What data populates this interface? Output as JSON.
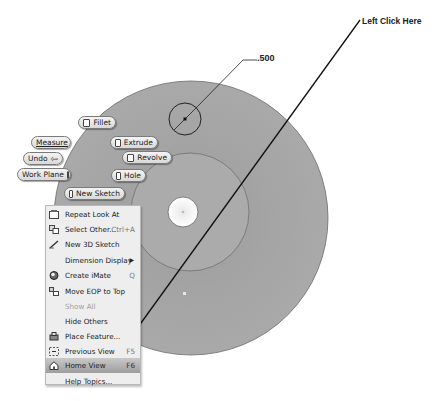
{
  "viewport": {
    "part": {
      "disk_color": "#a6a6a6",
      "hub_color": "#aaaaaa",
      "hole_color": "#ffffff",
      "outer_center": [
        191,
        218
      ],
      "outer_radius": 137,
      "hub_center": [
        190,
        212
      ],
      "hub_radius": 59,
      "hole_center": [
        183,
        212
      ],
      "hole_radius": 15,
      "sketch_circle_center": [
        185,
        119
      ],
      "sketch_circle_radius": 16
    },
    "dimension": {
      "value": ".500"
    },
    "callout": {
      "text": "Left Click Here"
    }
  },
  "marking_menu": {
    "fillet": "Fillet",
    "measure": "Measure",
    "extrude": "Extrude",
    "undo": "Undo",
    "revolve": "Revolve",
    "work_plane": "Work Plane",
    "hole": "Hole",
    "new_sketch": "New Sketch"
  },
  "context_menu": {
    "items": [
      {
        "label": "Repeat Look At",
        "hotkey": "",
        "icon": "look-at-icon"
      },
      {
        "label": "Select Other...",
        "hotkey": "Ctrl+A",
        "icon": "select-other-icon"
      },
      {
        "label": "New 3D Sketch",
        "hotkey": "",
        "icon": "3d-sketch-icon"
      },
      {
        "label": "Dimension Display",
        "hotkey": "",
        "icon": "",
        "submenu": "▶"
      },
      {
        "label": "Create iMate",
        "hotkey": "Q",
        "icon": "imate-icon"
      },
      {
        "label": "Move EOP to Top",
        "hotkey": "",
        "icon": "eop-icon"
      },
      {
        "label": "Show All",
        "hotkey": "",
        "icon": "",
        "disabled": true
      },
      {
        "label": "Hide Others",
        "hotkey": "",
        "icon": ""
      },
      {
        "label": "Place Feature...",
        "hotkey": "",
        "icon": "place-feature-icon"
      },
      {
        "label": "Previous View",
        "hotkey": "F5",
        "icon": "previous-view-icon"
      },
      {
        "label": "Home View",
        "hotkey": "F6",
        "icon": "home-view-icon",
        "active": true
      },
      {
        "label": "Help Topics...",
        "hotkey": "",
        "icon": ""
      }
    ]
  }
}
